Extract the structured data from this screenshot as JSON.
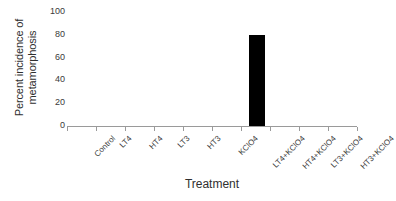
{
  "chart_data": {
    "type": "bar",
    "title": "",
    "xlabel": "Treatment",
    "ylabel": "Percent incidence of metamorphosis",
    "ylabel_lines": [
      "Percent incidence of",
      "metamorphosis"
    ],
    "categories": [
      "Control",
      "LT4",
      "HT4",
      "LT3",
      "HT3",
      "KClO4",
      "LT4+KClO4",
      "HT4+KClO4",
      "LT3+KClO4",
      "HT3+KClO4"
    ],
    "values": [
      0,
      0,
      0,
      0,
      0,
      0,
      80,
      0,
      0,
      0
    ],
    "ylim": [
      0,
      100
    ],
    "yticks": [
      0,
      20,
      40,
      60,
      80,
      100
    ],
    "ytick_labels": [
      "0",
      "20",
      "40",
      "60",
      "80",
      "100"
    ],
    "grid": false,
    "legend": false,
    "bar_color": "#000000",
    "axis_color": "#9a9a9a",
    "text_color": "#3a3a3a"
  }
}
